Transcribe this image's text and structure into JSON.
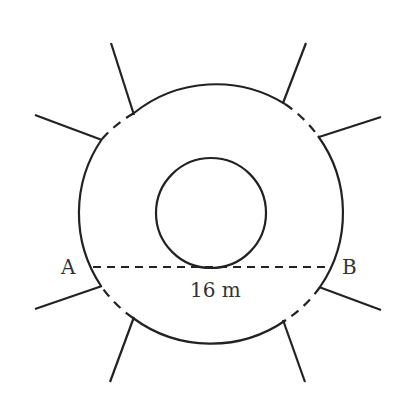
{
  "diagram": {
    "labels": {
      "point_a": "A",
      "point_b": "B",
      "chord_length": "16 m"
    },
    "colors": {
      "stroke": "#222222",
      "text": "#333333",
      "background": "#ffffff"
    },
    "geometry": {
      "outer_circle": {
        "cx": 211,
        "cy": 212,
        "r": 131
      },
      "inner_circle": {
        "cx": 211,
        "cy": 213,
        "r": 55
      },
      "chord_ab": {
        "x1": 92,
        "y1": 267,
        "x2": 331,
        "y2": 267,
        "style": "dashed"
      },
      "spokes": [
        {
          "name": "upper-left-top",
          "x1": 111,
          "y1": 43,
          "x2": 134,
          "y2": 115
        },
        {
          "name": "upper-left-side",
          "x1": 35,
          "y1": 115,
          "x2": 102,
          "y2": 140
        },
        {
          "name": "upper-right-top",
          "x1": 306,
          "y1": 43,
          "x2": 283,
          "y2": 103
        },
        {
          "name": "upper-right-side",
          "x1": 381,
          "y1": 117,
          "x2": 319,
          "y2": 137
        },
        {
          "name": "lower-left-side",
          "x1": 35,
          "y1": 309,
          "x2": 102,
          "y2": 286
        },
        {
          "name": "lower-left-bottom",
          "x1": 110,
          "y1": 382,
          "x2": 134,
          "y2": 317
        },
        {
          "name": "lower-right-side",
          "x1": 381,
          "y1": 310,
          "x2": 319,
          "y2": 287
        },
        {
          "name": "lower-right-bottom",
          "x1": 305,
          "y1": 382,
          "x2": 283,
          "y2": 320
        }
      ]
    }
  }
}
